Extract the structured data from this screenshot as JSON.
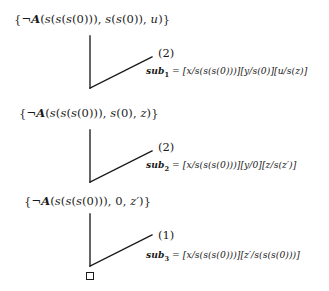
{
  "page": {
    "width": 329,
    "height": 291,
    "background": "#ffffff",
    "ink": "#1a1a1a",
    "kind": "resolution-derivation-steps"
  },
  "steps": [
    {
      "clause": "{¬A(s(s(s(0))), s(s(0)), u)}",
      "rule_label": "(2)",
      "subst_name": "sub",
      "subst_index": "1",
      "subst_equals": "=",
      "subst_value": "[x/s(s(s(0)))][y/s(0)][u/s(z)]",
      "subst_full": "sub₁ = [x/s(s(s(0)))][y/s(0)][u/s(z)]"
    },
    {
      "clause": "{¬A(s(s(s(0))), s(0), z)}",
      "rule_label": "(2)",
      "subst_name": "sub",
      "subst_index": "2",
      "subst_equals": "=",
      "subst_value": "[x/s(s(s(0)))][y/0][z/s(z′)]",
      "subst_full": "sub₂ = [x/s(s(s(0)))][y/0][z/s(z′)]"
    },
    {
      "clause": "{¬A(s(s(s(0))), 0, z′)}",
      "rule_label": "(1)",
      "subst_name": "sub",
      "subst_index": "3",
      "subst_equals": "=",
      "subst_value": "[x/s(s(s(0)))][z′/s(s(s(0)))]",
      "subst_full": "sub₃ = [x/s(s(s(0)))][z′/s(s(s(0)))]"
    }
  ],
  "empty_clause": {
    "glyph": "□",
    "meaning": "empty-clause-box"
  }
}
